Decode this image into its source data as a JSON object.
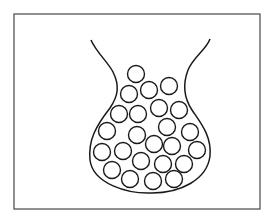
{
  "diagram": {
    "title": "",
    "colors": {
      "stroke": "#1a1a1a",
      "frame": "#555555",
      "background": "#ffffff"
    },
    "frame": {
      "x": 14,
      "y": 14,
      "width": 246,
      "height": 195
    },
    "container": {
      "shape": "flask",
      "neck_left_top": [
        91,
        40
      ],
      "neck_right_top": [
        210,
        39
      ],
      "bottom_y": 192
    },
    "particles": [
      {
        "cx": 136,
        "cy": 74
      },
      {
        "cx": 129,
        "cy": 94
      },
      {
        "cx": 149,
        "cy": 90
      },
      {
        "cx": 169,
        "cy": 86
      },
      {
        "cx": 119,
        "cy": 114
      },
      {
        "cx": 138,
        "cy": 114
      },
      {
        "cx": 159,
        "cy": 108
      },
      {
        "cx": 179,
        "cy": 110
      },
      {
        "cx": 107,
        "cy": 131
      },
      {
        "cx": 137,
        "cy": 135
      },
      {
        "cx": 167,
        "cy": 127
      },
      {
        "cx": 190,
        "cy": 132
      },
      {
        "cx": 102,
        "cy": 152
      },
      {
        "cx": 123,
        "cy": 151
      },
      {
        "cx": 154,
        "cy": 144
      },
      {
        "cx": 172,
        "cy": 146
      },
      {
        "cx": 197,
        "cy": 150
      },
      {
        "cx": 112,
        "cy": 170
      },
      {
        "cx": 141,
        "cy": 161
      },
      {
        "cx": 163,
        "cy": 164
      },
      {
        "cx": 184,
        "cy": 164
      },
      {
        "cx": 130,
        "cy": 179
      },
      {
        "cx": 153,
        "cy": 181
      },
      {
        "cx": 174,
        "cy": 179
      }
    ],
    "particle_radius": 8.5
  }
}
